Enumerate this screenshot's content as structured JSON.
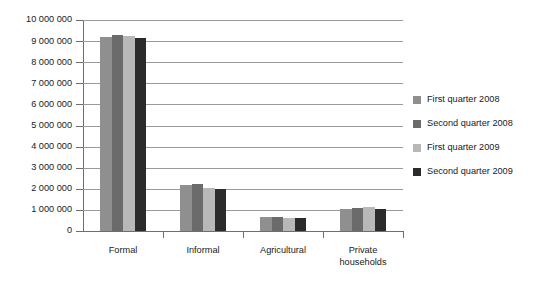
{
  "chart_data": {
    "type": "bar",
    "title": "",
    "xlabel": "",
    "ylabel": "",
    "ylim": [
      0,
      10000000
    ],
    "ytick_step": 1000000,
    "grid": true,
    "legend_position": "right",
    "categories": [
      "Formal",
      "Informal",
      "Agricultural",
      "Private\nhouseholds"
    ],
    "category_labels": [
      {
        "line1": "Formal",
        "line2": ""
      },
      {
        "line1": "Informal",
        "line2": ""
      },
      {
        "line1": "Agricultural",
        "line2": ""
      },
      {
        "line1": "Private",
        "line2": "households"
      }
    ],
    "ytick_labels": [
      "10 000 000",
      "9 000 000",
      "8 000 000",
      "7 000 000",
      "6 000 000",
      "5 000 000",
      "4 000 000",
      "3 000 000",
      "2 000 000",
      "1 000 000",
      "0"
    ],
    "ytick_values": [
      10000000,
      9000000,
      8000000,
      7000000,
      6000000,
      5000000,
      4000000,
      3000000,
      2000000,
      1000000,
      0
    ],
    "series": [
      {
        "name": "First quarter 2008",
        "color": "#8f8f8f",
        "values": [
          9200000,
          2200000,
          650000,
          1050000
        ]
      },
      {
        "name": "Second quarter 2008",
        "color": "#6b6b6b",
        "values": [
          9300000,
          2250000,
          680000,
          1100000
        ]
      },
      {
        "name": "First quarter 2009",
        "color": "#b8b8b8",
        "values": [
          9230000,
          2060000,
          640000,
          1150000
        ]
      },
      {
        "name": "Second quarter 2009",
        "color": "#2b2b2b",
        "values": [
          9150000,
          2010000,
          630000,
          1030000
        ]
      }
    ]
  },
  "legend": {
    "items": [
      {
        "label": "First quarter 2008",
        "color": "#8f8f8f"
      },
      {
        "label": "Second quarter 2008",
        "color": "#6b6b6b"
      },
      {
        "label": "First quarter 2009",
        "color": "#b8b8b8"
      },
      {
        "label": "Second quarter 2009",
        "color": "#2b2b2b"
      }
    ]
  }
}
